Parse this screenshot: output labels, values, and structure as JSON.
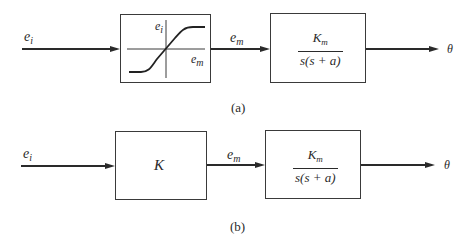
{
  "diagram": {
    "panel_a": {
      "caption": "(a)",
      "input_signal": {
        "base": "e",
        "sub": "i"
      },
      "nonlinear_block": {
        "type": "saturation-curve",
        "y_axis_label": {
          "base": "e",
          "sub": "i"
        },
        "x_axis_label": {
          "base": "e",
          "sub": "m"
        }
      },
      "intermediate_signal": {
        "base": "e",
        "sub": "m"
      },
      "motor_block": {
        "numerator": {
          "base": "K",
          "sub": "m"
        },
        "denominator": "s(s + a)"
      },
      "output_signal": "θ"
    },
    "panel_b": {
      "caption": "(b)",
      "input_signal": {
        "base": "e",
        "sub": "i"
      },
      "gain_block": {
        "label": "K"
      },
      "intermediate_signal": {
        "base": "e",
        "sub": "m"
      },
      "motor_block": {
        "numerator": {
          "base": "K",
          "sub": "m"
        },
        "denominator": "s(s + a)"
      },
      "output_signal": "θ"
    }
  }
}
